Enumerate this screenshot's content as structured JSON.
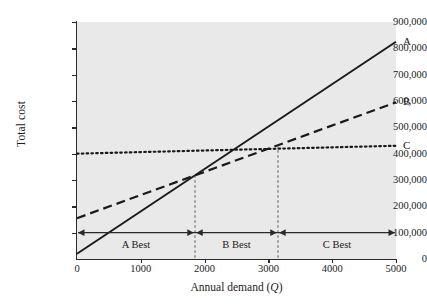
{
  "chart_data": {
    "type": "line",
    "title": "",
    "xlabel": "Annual demand (Q)",
    "ylabel": "Total cost",
    "xlim": [
      0,
      5000
    ],
    "ylim": [
      0,
      900000
    ],
    "grid": false,
    "legend_position": "right-of-line-ends",
    "x_ticks": [
      "0",
      "1000",
      "2000",
      "3000",
      "4000",
      "5000"
    ],
    "x_tick_values": [
      0,
      1000,
      2000,
      3000,
      4000,
      5000
    ],
    "y_ticks": [
      "0",
      "100,000",
      "200,000",
      "300,000",
      "400,000",
      "500,000",
      "600,000",
      "700,000",
      "800,000",
      "900,000"
    ],
    "y_tick_values": [
      0,
      100000,
      200000,
      300000,
      400000,
      500000,
      600000,
      700000,
      800000,
      900000
    ],
    "series": [
      {
        "name": "A",
        "label": "A",
        "style": "solid",
        "x": [
          0,
          5000
        ],
        "values": [
          20000,
          825000
        ],
        "fixed_cost": 20000,
        "variable_cost_per_unit": 161
      },
      {
        "name": "B",
        "label": "B",
        "style": "dashed",
        "x": [
          0,
          5000
        ],
        "values": [
          155000,
          595000
        ],
        "fixed_cost": 155000,
        "variable_cost_per_unit": 88
      },
      {
        "name": "C",
        "label": "C",
        "style": "dotted",
        "x": [
          0,
          5000
        ],
        "values": [
          400000,
          430000
        ],
        "fixed_cost": 400000,
        "variable_cost_per_unit": 6
      }
    ],
    "annotations": {
      "breakpoints": [
        {
          "name": "breakpoint-a-b",
          "x": 1850,
          "y": 318000
        },
        {
          "name": "breakpoint-b-c",
          "x": 3150,
          "y": 432000
        }
      ],
      "range_line_y": 100000,
      "regions": [
        {
          "name": "region-a-best",
          "label": "A Best",
          "x_start": 0,
          "x_end": 1850,
          "x_center": 925
        },
        {
          "name": "region-b-best",
          "label": "B Best",
          "x_start": 1850,
          "x_end": 3150,
          "x_center": 2500
        },
        {
          "name": "region-c-best",
          "label": "C Best",
          "x_start": 3150,
          "x_end": 5000,
          "x_center": 4075
        }
      ]
    },
    "colors": {
      "plot_background": "#e9e9e9",
      "page_background": "#ffffff",
      "axis": "#2a2a2a",
      "series": "#1a1a1a",
      "breakpoint_guide": "#4a4a4a"
    }
  }
}
